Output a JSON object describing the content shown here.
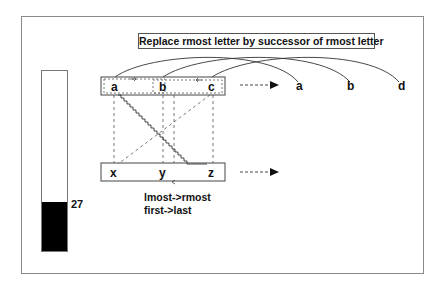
{
  "title": "Replace rmost letter by successor of rmost letter",
  "bar": {
    "value": "27",
    "fill_percent": 27,
    "fill_color": "#000000"
  },
  "initial_string": [
    "a",
    "b",
    "c"
  ],
  "modified_string": [
    "a",
    "b",
    "d"
  ],
  "target_string": [
    "x",
    "y",
    "z"
  ],
  "target_result": [],
  "caption": {
    "line1": "lmost->rmost",
    "line2": "first->last"
  },
  "icons": {
    "arrow_top": "dashed-right-arrow",
    "arrow_bottom": "dashed-right-arrow"
  }
}
